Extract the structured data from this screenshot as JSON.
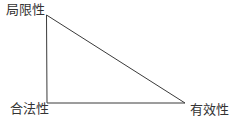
{
  "diagram": {
    "type": "right-triangle",
    "line_color": "#3a3a3a",
    "vertices": {
      "top": {
        "label": "局限性",
        "x": 46,
        "y": 15
      },
      "bottom_left": {
        "label": "合法性",
        "x": 47,
        "y": 103
      },
      "bottom_right": {
        "label": "有效性",
        "x": 185,
        "y": 103
      }
    }
  }
}
